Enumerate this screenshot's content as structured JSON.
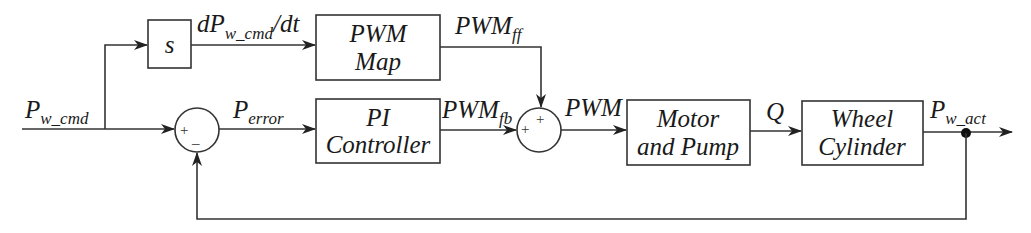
{
  "diagram": {
    "type": "control-block-diagram",
    "signals": {
      "input": {
        "main": "P",
        "sub": "w_cmd"
      },
      "derivative": {
        "prefix": "dP",
        "sub": "w_cmd",
        "suffix": "/dt"
      },
      "error": {
        "main": "P",
        "sub": "error"
      },
      "pwm_ff": {
        "main": "PWM",
        "sub": "ff"
      },
      "pwm_fb": {
        "main": "PWM",
        "sub": "fb"
      },
      "pwm": {
        "main": "PWM"
      },
      "flow": {
        "main": "Q"
      },
      "output": {
        "main": "P",
        "sub": "w_act"
      }
    },
    "blocks": {
      "derivative": {
        "line1": "s"
      },
      "pwm_map": {
        "line1": "PWM",
        "line2": "Map"
      },
      "pi_controller": {
        "line1": "PI",
        "line2": "Controller"
      },
      "motor_pump": {
        "line1": "Motor",
        "line2": "and Pump"
      },
      "wheel_cylinder": {
        "line1": "Wheel",
        "line2": "Cylinder"
      }
    },
    "summing_junctions": {
      "error_sum": {
        "plus": "+",
        "minus": "_"
      },
      "pwm_sum": {
        "plus_left": "+",
        "plus_top": "+"
      }
    }
  }
}
